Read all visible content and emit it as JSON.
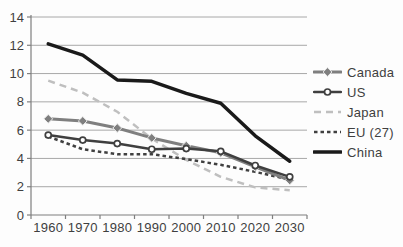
{
  "chart_data": {
    "type": "line",
    "categories": [
      "1960",
      "1970",
      "1980",
      "1990",
      "2000",
      "2010",
      "2020",
      "2030"
    ],
    "series": [
      {
        "name": "Canada",
        "color": "#7f7f7f",
        "marker": "diamond",
        "dash": "solid",
        "line_width": 3,
        "values": [
          6.8,
          6.65,
          6.15,
          5.45,
          4.9,
          4.4,
          3.4,
          2.45
        ]
      },
      {
        "name": "US",
        "color": "#3f3f3f",
        "marker": "circle-open",
        "dash": "solid",
        "line_width": 2.5,
        "values": [
          5.65,
          5.3,
          5.05,
          4.65,
          4.7,
          4.5,
          3.5,
          2.7
        ]
      },
      {
        "name": "Japan",
        "color": "#bfbfbf",
        "marker": "none",
        "dash": "long-dash",
        "line_width": 2.5,
        "values": [
          9.5,
          8.65,
          7.3,
          5.4,
          3.9,
          2.7,
          1.95,
          1.75
        ]
      },
      {
        "name": "EU (27)",
        "color": "#404040",
        "marker": "none",
        "dash": "short-dash",
        "line_width": 2.5,
        "values": [
          5.55,
          4.65,
          4.3,
          4.3,
          3.95,
          3.55,
          3.05,
          2.5
        ]
      },
      {
        "name": "China",
        "color": "#1a1a1a",
        "marker": "none",
        "dash": "solid",
        "line_width": 3.5,
        "values": [
          12.1,
          11.3,
          9.55,
          9.45,
          8.6,
          7.9,
          5.6,
          3.8
        ]
      }
    ],
    "ylim": [
      0,
      14
    ],
    "ytick_step": 2,
    "grid": true,
    "legend_position": "right",
    "axis_color": "#7f7f7f",
    "grid_color": "#a8a8a8",
    "text_color": "#3f3f3f"
  }
}
